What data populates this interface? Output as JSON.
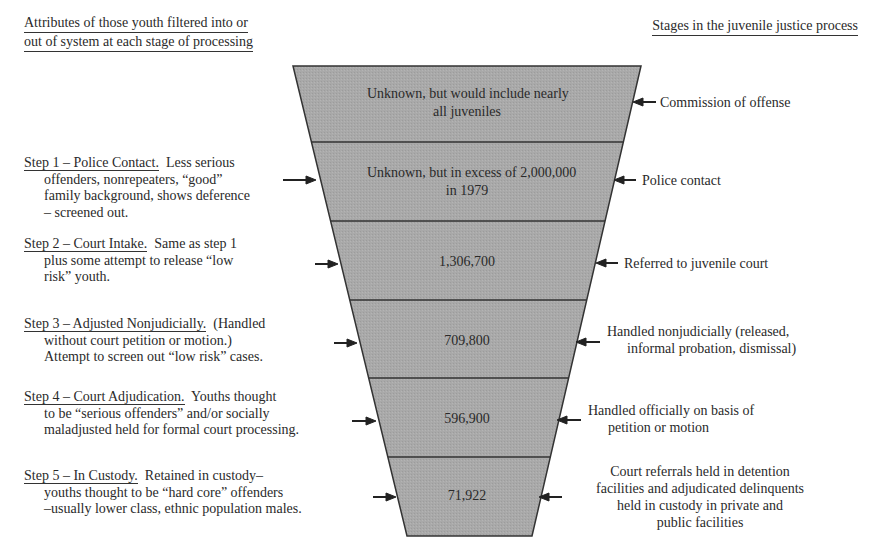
{
  "headings": {
    "left_line1": "Attributes of those youth filtered into or",
    "left_line2": "out of system at each stage of processing",
    "right": "Stages in the juvenile justice process"
  },
  "funnel": {
    "fill_color": "#a9a9a9",
    "stroke_color": "#333333",
    "bands": [
      {
        "line1": "Unknown, but would include nearly",
        "line2": "all juveniles"
      },
      {
        "line1": "Unknown, but in excess of 2,000,000",
        "line2": "in 1979"
      },
      {
        "line1": "1,306,700"
      },
      {
        "line1": "709,800"
      },
      {
        "line1": "596,900"
      },
      {
        "line1": "71,922"
      }
    ]
  },
  "steps": [
    {
      "title": "Step 1 – Police Contact.",
      "lines": [
        "Less serious",
        "offenders, nonrepeaters, “good”",
        "family background, shows deference",
        "– screened out."
      ]
    },
    {
      "title": "Step 2 – Court Intake.",
      "lines": [
        "Same as step 1",
        "plus some attempt to release “low",
        "risk” youth."
      ]
    },
    {
      "title": "Step 3 – Adjusted Nonjudicially.",
      "lines": [
        "(Handled",
        "without court petition or motion.)",
        "Attempt to screen out “low risk” cases."
      ]
    },
    {
      "title": "Step 4 – Court Adjudication.",
      "lines": [
        "Youths thought",
        "to be “serious offenders” and/or socially",
        "maladjusted held for formal court processing."
      ]
    },
    {
      "title": "Step 5 – In Custody.",
      "lines": [
        "Retained in custody–",
        "youths thought to be “hard core” offenders",
        "–usually lower class, ethnic population males."
      ]
    }
  ],
  "stages": [
    {
      "lines": [
        "Commission of offense"
      ]
    },
    {
      "lines": [
        "Police contact"
      ]
    },
    {
      "lines": [
        "Referred to juvenile court"
      ]
    },
    {
      "lines": [
        "Handled nonjudicially (released,",
        "informal probation, dismissal)"
      ]
    },
    {
      "lines": [
        "Handled officially on basis of",
        "petition or motion"
      ]
    },
    {
      "lines": [
        "Court referrals held in detention",
        "facilities and adjudicated delinquents",
        "held in custody in private and",
        "public facilities"
      ]
    }
  ],
  "icons": {
    "left_arrow": "right-pointing-arrow-icon",
    "right_arrow": "left-pointing-arrow-icon"
  }
}
